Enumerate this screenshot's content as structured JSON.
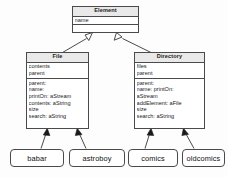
{
  "diagram": {
    "type": "uml-class-diagram",
    "stroke_color": "#4a4a4a",
    "title_fill_color": "#e9e9e9",
    "background_color": "#fdfdfd"
  },
  "classes": [
    {
      "id": "element",
      "name": "Element",
      "attributes": [
        "name"
      ],
      "operations": []
    },
    {
      "id": "file",
      "name": "File",
      "attributes": [
        "contents",
        "parent"
      ],
      "operations": [
        "parent:",
        "name:",
        "printOn: aStream",
        "contents: aString",
        "size",
        "search: aString"
      ]
    },
    {
      "id": "directory",
      "name": "Directory",
      "attributes": [
        "files",
        "parent"
      ],
      "operations": [
        "parent:",
        "name: printOn:",
        "aStream",
        "addElement: aFile",
        "size",
        "search: aString"
      ]
    }
  ],
  "instances": [
    {
      "id": "babar",
      "label": "babar",
      "of": "File"
    },
    {
      "id": "astroboy",
      "label": "astroboy",
      "of": "File"
    },
    {
      "id": "comics",
      "label": "comics",
      "of": "Directory"
    },
    {
      "id": "oldcomics",
      "label": "oldcomics",
      "of": "Directory"
    }
  ],
  "relations": [
    {
      "kind": "generalization",
      "from": "File",
      "to": "Element",
      "arrowhead": "hollow-triangle"
    },
    {
      "kind": "generalization",
      "from": "Directory",
      "to": "Element",
      "arrowhead": "hollow-triangle"
    },
    {
      "kind": "instance-of",
      "from": "babar",
      "to": "File",
      "arrowhead": "solid"
    },
    {
      "kind": "instance-of",
      "from": "astroboy",
      "to": "File",
      "arrowhead": "solid"
    },
    {
      "kind": "instance-of",
      "from": "comics",
      "to": "Directory",
      "arrowhead": "solid"
    },
    {
      "kind": "instance-of",
      "from": "oldcomics",
      "to": "Directory",
      "arrowhead": "solid"
    }
  ]
}
